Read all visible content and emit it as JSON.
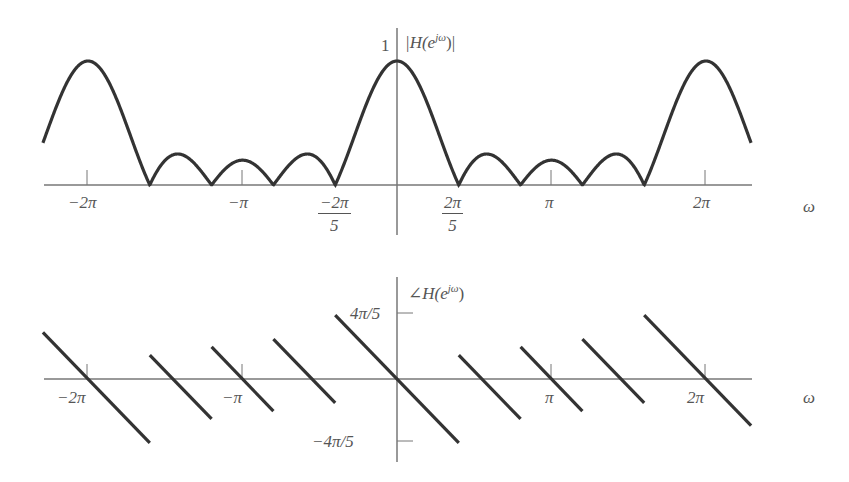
{
  "chart_data": [
    {
      "type": "line",
      "title": "|H(e^{jω})|",
      "ylabel": "|H(e^{jω})|",
      "xlabel": "ω",
      "x_ticks": [
        "-2π",
        "-π",
        "-2π/5",
        "2π/5",
        "π",
        "2π"
      ],
      "y_ticks": [
        "1"
      ],
      "xlim": [
        -7.2,
        7.2
      ],
      "ylim": [
        0,
        1
      ],
      "description": "Magnitude of 5-point moving average: |sin(5ω/2)/(5 sin(ω/2))|, periodic with 2π; main lobes at 0, ±2π with peak 1, zeros at multiples of 2π/5",
      "series": [
        {
          "name": "magnitude",
          "x": [
            -7.2,
            -6.2832,
            -5.0265,
            -4.3982,
            -3.7699,
            -3.1416,
            -2.5133,
            -1.885,
            -1.2566,
            0,
            1.2566,
            1.885,
            2.5133,
            3.1416,
            3.7699,
            4.3982,
            5.0265,
            6.2832,
            7.2
          ],
          "y": [
            0.55,
            1.0,
            0.0,
            0.25,
            0.0,
            0.2,
            0.0,
            0.25,
            0.0,
            1.0,
            0.0,
            0.25,
            0.0,
            0.2,
            0.0,
            0.25,
            0.0,
            1.0,
            0.55
          ]
        }
      ],
      "grid": false,
      "legend": false
    },
    {
      "type": "line",
      "title": "∠H(e^{jω})",
      "ylabel": "∠H(e^{jω})",
      "xlabel": "ω",
      "x_ticks": [
        "-2π",
        "-π",
        "π",
        "2π"
      ],
      "y_ticks": [
        "4π/5",
        "-4π/5"
      ],
      "xlim": [
        -7.2,
        7.2
      ],
      "ylim": [
        -2.5133,
        2.5133
      ],
      "description": "Phase -2ω with jumps of π at zeros of the magnitude (multiples of 2π/5), periodic with 2π; linear segments of slope -2",
      "series": [
        {
          "name": "phase segments",
          "segments": [
            {
              "x": [
                -7.2,
                -5.0265
              ],
              "y": [
                1.83,
                -2.51
              ]
            },
            {
              "x": [
                -5.0265,
                -3.7699
              ],
              "y": [
                0.94,
                -1.57
              ]
            },
            {
              "x": [
                -3.7699,
                -2.5133
              ],
              "y": [
                1.26,
                -1.26
              ]
            },
            {
              "x": [
                -2.5133,
                -1.2566
              ],
              "y": [
                1.57,
                -0.94
              ]
            },
            {
              "x": [
                -1.2566,
                1.2566
              ],
              "y": [
                2.51,
                -2.51
              ]
            },
            {
              "x": [
                1.2566,
                2.5133
              ],
              "y": [
                0.94,
                -1.57
              ]
            },
            {
              "x": [
                2.5133,
                3.7699
              ],
              "y": [
                1.26,
                -1.26
              ]
            },
            {
              "x": [
                3.7699,
                5.0265
              ],
              "y": [
                1.57,
                -0.94
              ]
            },
            {
              "x": [
                5.0265,
                7.2
              ],
              "y": [
                2.51,
                -1.83
              ]
            }
          ]
        }
      ],
      "grid": false,
      "legend": false
    }
  ],
  "top": {
    "ylabel_prefix": "|H(e",
    "ylabel_sup": "jω",
    "ylabel_suffix": ")|",
    "y_tick_1": "1",
    "xlabel": "ω",
    "tick_m2pi": "−2π",
    "tick_mpi": "−π",
    "tick_m2pi5_num": "−2π",
    "tick_m2pi5_den": "5",
    "tick_2pi5_num": "2π",
    "tick_2pi5_den": "5",
    "tick_pi": "π",
    "tick_2pi": "2π"
  },
  "bottom": {
    "ylabel_prefix": "∠H(e",
    "ylabel_sup": "jω",
    "ylabel_suffix": ")",
    "y_tick_pos": "4π/5",
    "y_tick_neg": "−4π/5",
    "xlabel": "ω",
    "tick_m2pi": "−2π",
    "tick_mpi": "−π",
    "tick_pi": "π",
    "tick_2pi": "2π"
  }
}
